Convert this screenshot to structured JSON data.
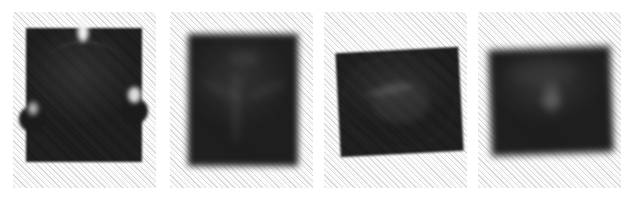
{
  "figure": {
    "name": "four-panel-specimen-plate",
    "width_px": 633,
    "height_px": 203,
    "panel_count": 4,
    "background_color": "#ffffff",
    "panel_background_color": "#f3f3f3",
    "specimen_color": "#191919",
    "texture": "diagonal-weave-45deg",
    "labels_visible": false,
    "axes_visible": false,
    "caption": ""
  },
  "panels": [
    {
      "index": 1,
      "name": "panel-1",
      "x": 13,
      "y": 12,
      "width": 143,
      "height": 176,
      "focus": "sharp",
      "specimen": {
        "name": "specimen-1",
        "shape": "apically notched obovate drupe",
        "outline_features": [
          "apical notch",
          "left basal lobe",
          "right lateral cleft",
          "shallow transverse ridge"
        ],
        "silhouette_color": "#1b1b1b",
        "bbox": {
          "x": 26,
          "y": 28,
          "width": 116,
          "height": 134
        }
      }
    },
    {
      "index": 2,
      "name": "panel-2",
      "x": 170,
      "y": 12,
      "width": 143,
      "height": 176,
      "focus": "blurred",
      "specimen": {
        "name": "specimen-2",
        "shape": "trigonous rounded-triangular nut",
        "outline_features": [
          "three longitudinal ridges",
          "rounded apex dent",
          "broad rounded base"
        ],
        "silhouette_color": "#1b1b1b",
        "bbox": {
          "x": 188,
          "y": 34,
          "width": 110,
          "height": 132
        }
      }
    },
    {
      "index": 3,
      "name": "panel-3",
      "x": 324,
      "y": 12,
      "width": 143,
      "height": 176,
      "focus": "sharp",
      "specimen": {
        "name": "specimen-3",
        "shape": "broad transversely ovate seed",
        "outline_features": [
          "central hilum depression",
          "oblique surface scar",
          "smooth rim"
        ],
        "silhouette_color": "#1b1b1b",
        "bbox": {
          "x": 338,
          "y": 50,
          "width": 123,
          "height": 104
        }
      }
    },
    {
      "index": 4,
      "name": "panel-4",
      "x": 478,
      "y": 12,
      "width": 143,
      "height": 176,
      "focus": "blurred",
      "specimen": {
        "name": "specimen-4",
        "shape": "ovoid seed, transversely elongate",
        "outline_features": [
          "central chalazal mark",
          "diffuse soft margin",
          "upper surface sheen"
        ],
        "silhouette_color": "#1b1b1b",
        "bbox": {
          "x": 490,
          "y": 48,
          "width": 122,
          "height": 106
        }
      }
    }
  ]
}
